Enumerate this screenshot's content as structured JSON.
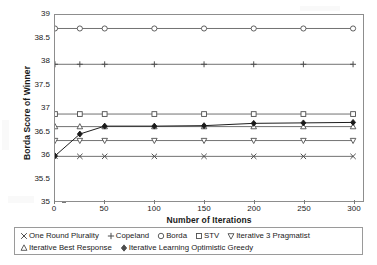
{
  "chart_data": {
    "type": "line",
    "title": "",
    "xlabel": "Number of Iterations",
    "ylabel": "Borda Score of Winner",
    "xlim": [
      0,
      310
    ],
    "ylim": [
      35,
      39
    ],
    "xticks": [
      0,
      50,
      100,
      150,
      200,
      250,
      300
    ],
    "yticks": [
      35,
      35.5,
      36,
      36.5,
      37,
      37.5,
      38,
      38.5,
      39
    ],
    "x": [
      0,
      25,
      50,
      100,
      150,
      200,
      250,
      300
    ],
    "grid": false,
    "legend_position": "below-axes",
    "series": [
      {
        "name": "One Round Plurality",
        "marker": "x-cross",
        "color": "#4d4d4d",
        "values": [
          35.96,
          35.96,
          35.96,
          35.96,
          35.96,
          35.96,
          35.96,
          35.96
        ]
      },
      {
        "name": "Copeland",
        "marker": "plus",
        "color": "#4d4d4d",
        "values": [
          37.94,
          37.94,
          37.94,
          37.94,
          37.94,
          37.94,
          37.94,
          37.94
        ]
      },
      {
        "name": "Borda",
        "marker": "circle-open",
        "color": "#4d4d4d",
        "values": [
          38.71,
          38.71,
          38.71,
          38.71,
          38.71,
          38.71,
          38.71,
          38.71
        ]
      },
      {
        "name": "STV",
        "marker": "square-open",
        "color": "#4d4d4d",
        "values": [
          36.87,
          36.87,
          36.87,
          36.87,
          36.87,
          36.87,
          36.87,
          36.87
        ]
      },
      {
        "name": "Iterative 3 Pragmatist",
        "marker": "triangle-down-open",
        "color": "#4d4d4d",
        "values": [
          36.3,
          36.3,
          36.3,
          36.3,
          36.3,
          36.3,
          36.3,
          36.3
        ]
      },
      {
        "name": "Iterative Best Response",
        "marker": "triangle-up-open",
        "color": "#4d4d4d",
        "values": [
          36.6,
          36.6,
          36.6,
          36.6,
          36.6,
          36.6,
          36.6,
          36.6
        ]
      },
      {
        "name": "Iterative Learning Optimistic Greedy",
        "marker": "diamond-filled",
        "color": "#1a1a1a",
        "values": [
          35.97,
          36.44,
          36.61,
          36.61,
          36.62,
          36.67,
          36.68,
          36.69
        ]
      }
    ]
  },
  "axes": {
    "x_title": "Number of Iterations",
    "y_title": "Borda Score of Winner",
    "x_tick_labels": [
      "0",
      "50",
      "100",
      "150",
      "200",
      "250",
      "300"
    ],
    "y_tick_labels": [
      "35",
      "35.5",
      "36",
      "36.5",
      "37",
      "37.5",
      "38",
      "38.5",
      "39"
    ]
  },
  "legend": {
    "rows": [
      [
        {
          "label": "One Round Plurality",
          "marker": "x-cross"
        },
        {
          "label": "Copeland",
          "marker": "plus"
        },
        {
          "label": "Borda",
          "marker": "circle-open"
        },
        {
          "label": "STV",
          "marker": "square-open"
        },
        {
          "label": "Iterative 3 Pragmatist",
          "marker": "triangle-down-open"
        }
      ],
      [
        {
          "label": "Iterative Best Response",
          "marker": "triangle-up-open"
        },
        {
          "label": "Iterative Learning Optimistic Greedy",
          "marker": "diamond-filled"
        }
      ]
    ]
  },
  "colors": {
    "line": "#4d4d4d",
    "highlight_line": "#1a1a1a",
    "frame": "#8d8d8d",
    "text": "#1a1a1a"
  }
}
